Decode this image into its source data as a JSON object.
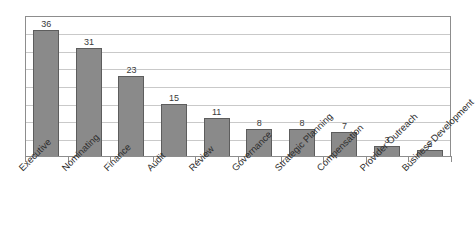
{
  "chart_data": {
    "type": "bar",
    "title": "",
    "subtitle": "",
    "xlabel": "",
    "ylabel": "",
    "ylim": [
      0,
      40
    ],
    "ytick_step": 5,
    "yticks": [
      0,
      5,
      10,
      15,
      20,
      25,
      30,
      35,
      40
    ],
    "ytick_labels_visible": false,
    "grid": "horizontal",
    "legend": "none",
    "bar_color": "#8a8a8a",
    "bar_border_color": "#5d5d5d",
    "gridline_color": "#c9c9c9",
    "frame_color": "#8d8d8d",
    "background_color": "#ffffff",
    "label_rotation_deg": -45,
    "data_labels_shown": true,
    "categories": [
      "Executive",
      "Nominating",
      "Finance",
      "Audit",
      "Review",
      "Governance",
      "Strategic Planning",
      "Compensation",
      "Provider Outreach",
      "Business Development"
    ],
    "values": [
      36,
      31,
      23,
      15,
      11,
      8,
      8,
      7,
      3,
      2
    ],
    "value_labels": [
      "36",
      "31",
      "23",
      "15",
      "11",
      "8",
      "8",
      "7",
      "3",
      "2"
    ]
  }
}
